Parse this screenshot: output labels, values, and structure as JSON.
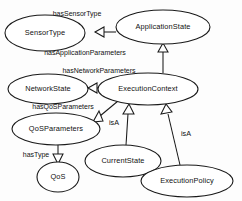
{
  "diagram": {
    "type": "ontology-class-diagram",
    "notation": "UML generalization (hollow triangle arrowheads)",
    "background_color": "#fdfdfd",
    "line_color": "#1a1a1a",
    "text_color": "#111111",
    "nodes": [
      {
        "id": "sensorType",
        "label": "SensorType",
        "cx": 45,
        "cy": 33,
        "rx": 40,
        "ry": 18
      },
      {
        "id": "applicationState",
        "label": "ApplicationState",
        "cx": 163,
        "cy": 27,
        "rx": 47,
        "ry": 17
      },
      {
        "id": "networkState",
        "label": "NetworkState",
        "cx": 48,
        "cy": 89,
        "rx": 40,
        "ry": 15
      },
      {
        "id": "executionContext",
        "label": "ExecutionContext",
        "cx": 148,
        "cy": 89,
        "rx": 50,
        "ry": 16
      },
      {
        "id": "qosParameters",
        "label": "QoSParameters",
        "cx": 56,
        "cy": 129,
        "rx": 44,
        "ry": 16
      },
      {
        "id": "qos",
        "label": "QoS",
        "cx": 58,
        "cy": 177,
        "rx": 21,
        "ry": 15
      },
      {
        "id": "currentState",
        "label": "CurrentState",
        "cx": 123,
        "cy": 161,
        "rx": 38,
        "ry": 16
      },
      {
        "id": "executionPolicy",
        "label": "ExecutionPolicy",
        "cx": 187,
        "cy": 181,
        "rx": 46,
        "ry": 16
      }
    ],
    "edges": [
      {
        "id": "edge-hasSensorType",
        "label": "hasSensorType",
        "from": "applicationState",
        "to": "sensorType",
        "label_x": 77,
        "label_y": 14
      },
      {
        "id": "edge-hasApplicationParameters",
        "label": "hasApplicationParameters",
        "from": "executionContext",
        "to": "applicationState",
        "label_x": 85,
        "label_y": 53
      },
      {
        "id": "edge-hasNetworkParameters",
        "label": "hasNetworkParameters",
        "from": "executionContext",
        "to": "networkState",
        "label_x": 99,
        "label_y": 71
      },
      {
        "id": "edge-hasQoSParameters",
        "label": "hasQoSParameters",
        "from": "executionContext",
        "to": "qosParameters",
        "label_x": 63,
        "label_y": 107
      },
      {
        "id": "edge-hasType",
        "label": "hasType",
        "from": "qosParameters",
        "to": "qos",
        "label_x": 36,
        "label_y": 155
      },
      {
        "id": "edge-isA-currentState",
        "label": "isA",
        "from": "currentState",
        "to": "executionContext",
        "label_x": 123,
        "label_y": 123
      },
      {
        "id": "edge-isA-executionPolicy",
        "label": "isA",
        "from": "executionPolicy",
        "to": "executionContext",
        "label_x": 177,
        "label_y": 133
      }
    ]
  }
}
